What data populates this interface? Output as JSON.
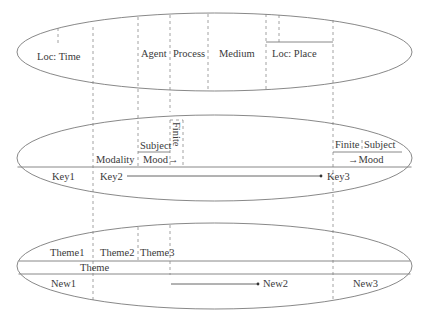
{
  "diagram": {
    "top_ellipse": {
      "labels": {
        "loc_time": "Loc: Time",
        "agent": "Agent",
        "process": "Process",
        "medium": "Medium",
        "loc_place": "Loc: Place"
      }
    },
    "middle_ellipse": {
      "labels": {
        "subject_left": "Subject",
        "finite_left": "Finite",
        "modality": "Modality",
        "mood_left": "Mood→",
        "finite_right": "Finite",
        "subject_right": "Subject",
        "mood_right": "→Mood",
        "key1": "Key1",
        "key2": "Key2",
        "key3": "Key3"
      }
    },
    "bottom_ellipse": {
      "labels": {
        "theme1": "Theme1",
        "theme2": "Theme2",
        "theme3": "Theme3",
        "theme": "Theme",
        "new1": "New1",
        "new2": "New2",
        "new3": "New3"
      }
    },
    "colors": {
      "line": "#7a7a7a",
      "text": "#3a3a3a",
      "background": "#ffffff"
    }
  }
}
